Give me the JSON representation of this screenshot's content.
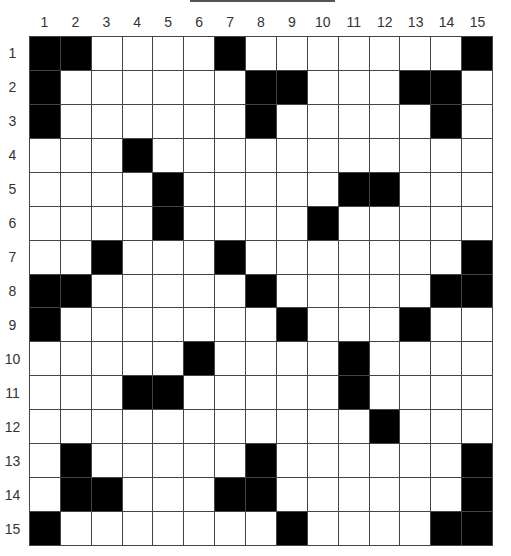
{
  "puzzle": {
    "type": "crossword-grid",
    "rows": 15,
    "cols": 15,
    "col_labels": [
      "1",
      "2",
      "3",
      "4",
      "5",
      "6",
      "7",
      "8",
      "9",
      "10",
      "11",
      "12",
      "13",
      "14",
      "15"
    ],
    "row_labels": [
      "1",
      "2",
      "3",
      "4",
      "5",
      "6",
      "7",
      "8",
      "9",
      "10",
      "11",
      "12",
      "13",
      "14",
      "15"
    ],
    "black_cells": {
      "1": [
        1,
        2,
        7,
        15
      ],
      "2": [
        1,
        8,
        9,
        13,
        14
      ],
      "3": [
        1,
        8,
        14
      ],
      "4": [
        4
      ],
      "5": [
        5,
        11,
        12
      ],
      "6": [
        5,
        10
      ],
      "7": [
        3,
        7,
        15
      ],
      "8": [
        1,
        2,
        8,
        14,
        15
      ],
      "9": [
        1,
        9,
        13
      ],
      "10": [
        6,
        11
      ],
      "11": [
        4,
        5,
        11
      ],
      "12": [
        12
      ],
      "13": [
        2,
        8,
        15
      ],
      "14": [
        2,
        3,
        7,
        8,
        15
      ],
      "15": [
        1,
        9,
        14,
        15
      ]
    },
    "colors": {
      "black": "#000000",
      "white": "#ffffff",
      "grid_line": "#444444"
    }
  }
}
